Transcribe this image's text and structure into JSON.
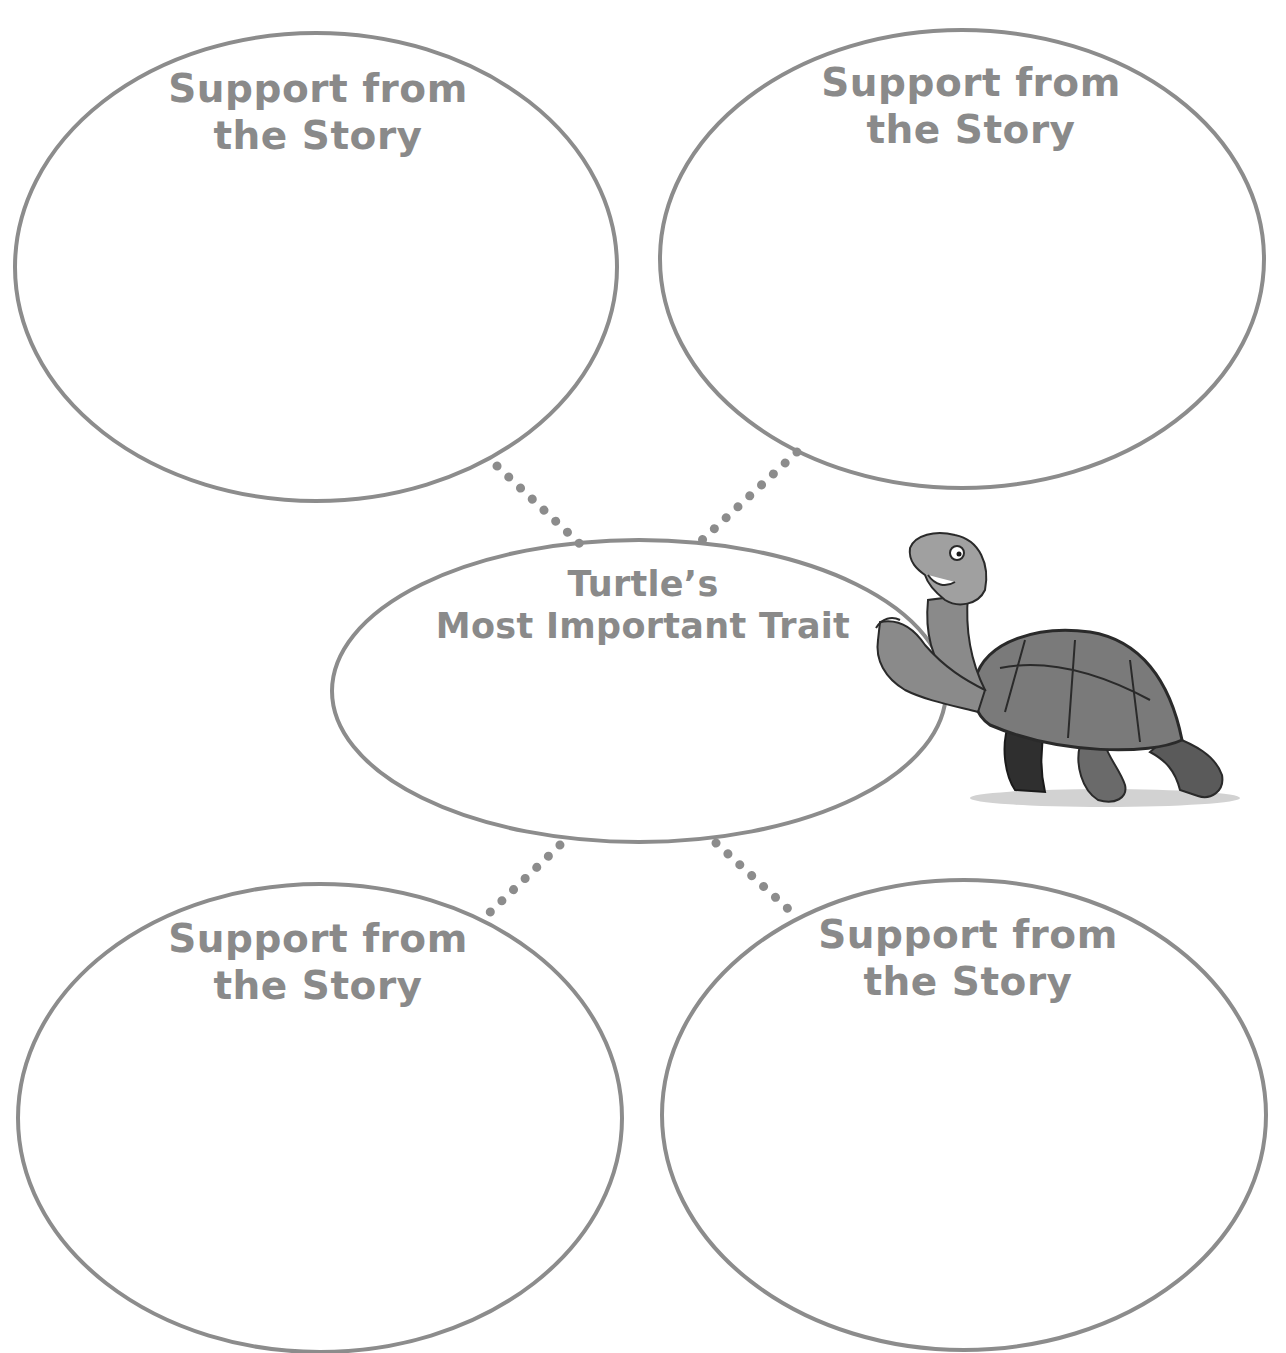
{
  "diagram": {
    "type": "character-trait web",
    "colors": {
      "stroke": "#8c8c8c",
      "text": "#8a8a8a",
      "background": "#ffffff"
    },
    "center": {
      "line1": "Turtle’s",
      "line2": "Most Important Trait"
    },
    "supports": [
      {
        "position": "top-left",
        "line1": "Support from",
        "line2": "the Story"
      },
      {
        "position": "top-right",
        "line1": "Support from",
        "line2": "the Story"
      },
      {
        "position": "bottom-left",
        "line1": "Support from",
        "line2": "the Story"
      },
      {
        "position": "bottom-right",
        "line1": "Support from",
        "line2": "the Story"
      }
    ],
    "illustration": {
      "icon": "turtle-illustration",
      "description": "Cartoon turtle pointing at the center oval"
    }
  }
}
